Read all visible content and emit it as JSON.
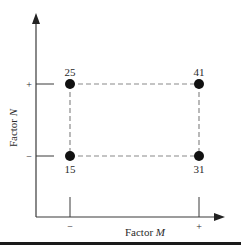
{
  "diagram": {
    "type": "two-factor design (2x2 factorial)",
    "x_axis": {
      "label_prefix": "Factor ",
      "label_var": "M",
      "levels": [
        "−",
        "+"
      ]
    },
    "y_axis": {
      "label_prefix": "Factor ",
      "label_var": "N",
      "levels": [
        "−",
        "+"
      ]
    },
    "points": [
      {
        "id": "low-low",
        "M": "−",
        "N": "−",
        "value": "15"
      },
      {
        "id": "high-low",
        "M": "+",
        "N": "−",
        "value": "31"
      },
      {
        "id": "low-high",
        "M": "−",
        "N": "+",
        "value": "25"
      },
      {
        "id": "high-high",
        "M": "+",
        "N": "+",
        "value": "41"
      }
    ],
    "colors": {
      "axis": "#3a3a3a",
      "dashed": "#8a8a8a",
      "point": "#111111",
      "text": "#2a2a2a"
    }
  }
}
